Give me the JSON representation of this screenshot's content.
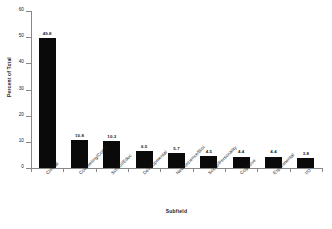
{
  "chart_data": {
    "type": "bar",
    "title": "",
    "xlabel": "Subfield",
    "ylabel": "Percent of Total",
    "ylim": [
      0,
      60
    ],
    "yticks": [
      0,
      10,
      20,
      30,
      40,
      50,
      60
    ],
    "grid": false,
    "legend": "none",
    "bar_color": "#0a0a0a",
    "categories": [
      "Clinical",
      "Counseling/Comm",
      "School/Educ",
      "Developmental",
      "Neuroscience/Biol",
      "Social/Personality",
      "Cognitive",
      "Experimental",
      "I/O"
    ],
    "values": [
      49.8,
      10.8,
      10.3,
      6.5,
      5.7,
      4.5,
      4.4,
      4.4,
      3.8
    ],
    "value_labels": [
      "49.8",
      "10.8",
      "10.3",
      "6.5",
      "5.7",
      "4.5",
      "4.4",
      "4.4",
      "3.8"
    ],
    "ytick_labels": [
      "0",
      "10",
      "20",
      "30",
      "40",
      "50",
      "60"
    ]
  }
}
